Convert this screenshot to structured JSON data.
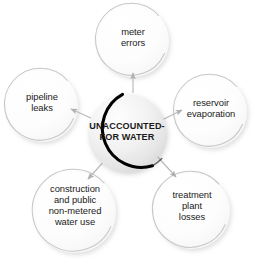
{
  "diagram": {
    "type": "radial-hub-and-spoke",
    "hub": {
      "id": "unaccounted-for-water",
      "label": "UNACCOUNTED-\nFOR WATER",
      "cx": 127,
      "cy": 133,
      "r": 39,
      "fill_light": "#fdfdfd",
      "fill_dark": "#dcdcdc",
      "outline_color": "#000000"
    },
    "satellites": [
      {
        "id": "meter-errors",
        "label": "meter\nerrors",
        "cx": 133,
        "cy": 41,
        "r": 36,
        "text_x": 133,
        "text_y": 38,
        "outline_color": "#c9c9c9",
        "fill": "#fcfcfc"
      },
      {
        "id": "reservoir-evaporation",
        "label": "reservoir\nevaporation",
        "cx": 211,
        "cy": 112,
        "r": 36,
        "text_x": 211,
        "text_y": 109,
        "outline_color": "#c9c9c9",
        "fill": "#fcfcfc"
      },
      {
        "id": "treatment-plant-losses",
        "label": "treatment\nplant\nlosses",
        "cx": 192,
        "cy": 211,
        "r": 38,
        "text_x": 192,
        "text_y": 206,
        "outline_color": "#c9c9c9",
        "fill": "#fcfcfc"
      },
      {
        "id": "construction-and-public-non-metered-water-use",
        "label": "construction\nand public\nnon-metered\nwater use",
        "cx": 75,
        "cy": 212,
        "r": 41,
        "text_x": 75,
        "text_y": 205,
        "outline_color": "#c9c9c9",
        "fill": "#fcfcfc"
      },
      {
        "id": "pipeline-leaks",
        "label": "pipeline\nleaks",
        "cx": 42,
        "cy": 106,
        "r": 36,
        "text_x": 42,
        "text_y": 103,
        "outline_color": "#c9c9c9",
        "fill": "#fcfcfc"
      }
    ],
    "connectors": [
      {
        "id": "arrow-to-meter-errors",
        "from": "unaccounted-for-water",
        "to": "meter-errors",
        "x1": 133,
        "y1": 92,
        "x2": 133,
        "y2": 74,
        "color": "#b9b9b9"
      },
      {
        "id": "arrow-to-reservoir-evaporation",
        "from": "unaccounted-for-water",
        "to": "reservoir-evaporation",
        "x1": 161,
        "y1": 120,
        "x2": 183,
        "y2": 110,
        "color": "#b9b9b9"
      },
      {
        "id": "arrow-to-treatment-plant-losses",
        "from": "unaccounted-for-water",
        "to": "treatment-plant-losses",
        "x1": 157,
        "y1": 155,
        "x2": 176,
        "y2": 176,
        "color": "#b9b9b9"
      },
      {
        "id": "arrow-to-construction-water-use",
        "from": "unaccounted-for-water",
        "to": "construction-and-public-non-metered-water-use",
        "x1": 106,
        "y1": 158,
        "x2": 88,
        "y2": 178,
        "color": "#b9b9b9"
      },
      {
        "id": "arrow-to-pipeline-leaks",
        "from": "unaccounted-for-water",
        "to": "pipeline-leaks",
        "x1": 92,
        "y1": 118,
        "x2": 70,
        "y2": 109,
        "color": "#b9b9b9"
      }
    ]
  }
}
